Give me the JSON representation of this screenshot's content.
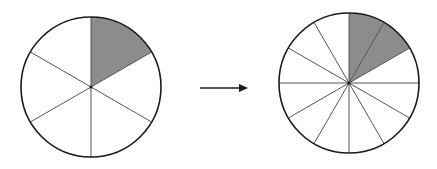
{
  "diagram": {
    "colors": {
      "stroke": "#1a1a1a",
      "divider": "#555555",
      "shade": "#8c8c8c",
      "background": "#ffffff"
    },
    "left_circle": {
      "cx": 91,
      "cy": 87,
      "r": 70,
      "segments": 6,
      "shaded": 1
    },
    "right_circle": {
      "cx": 349,
      "cy": 83,
      "r": 70,
      "segments": 12,
      "shaded": 2
    },
    "arrow": {
      "x1": 200,
      "y1": 88,
      "x2": 248,
      "y2": 88
    }
  }
}
